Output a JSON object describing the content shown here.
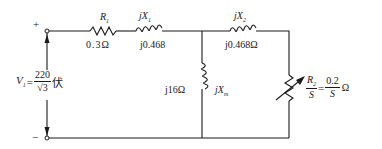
{
  "circuit": {
    "terminals": {
      "plus": "+",
      "minus": "−"
    },
    "source": {
      "symbol": "V",
      "subscript": "1",
      "equals": "=",
      "numerator": "220",
      "denominator": "√3",
      "unit": "伏"
    },
    "r1": {
      "symbol": "R",
      "subscript": "1",
      "value": "0.3Ω"
    },
    "x1": {
      "symbol": "jX",
      "subscript": "1",
      "value": "j0.468"
    },
    "x2": {
      "symbol": "jX",
      "subscript": "2",
      "value": "j0.468Ω"
    },
    "xm": {
      "symbol": "jX",
      "subscript": "m",
      "value": "j16Ω"
    },
    "r2": {
      "lhs_numerator": "R",
      "lhs_subscript": "2",
      "lhs_denominator": "S",
      "equals": "=",
      "rhs_numerator": "0.2",
      "rhs_denominator": "S",
      "unit": "Ω"
    },
    "colors": {
      "line": "#1a1a1a",
      "background": "#ffffff"
    }
  }
}
